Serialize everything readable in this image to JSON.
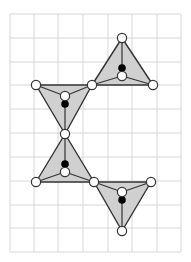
{
  "diagram": {
    "type": "tetrahedra-chain-on-grid",
    "colors": {
      "background": "#ffffff",
      "grid": "#d6d6d6",
      "fill": "#d0d0d0",
      "stroke": "#333333",
      "open_atom": "#ffffff",
      "filled_atom": "#000000"
    },
    "grid": {
      "x_lines": [
        10,
        34,
        58,
        83,
        108,
        132,
        157,
        181
      ],
      "y_lines": [
        14,
        38,
        62,
        85,
        109,
        133,
        157,
        181,
        205,
        228,
        252
      ]
    },
    "triangles": [
      {
        "name": "tetra-1",
        "corners": [
          [
            122,
            38
          ],
          [
            92,
            85
          ],
          [
            153,
            85
          ]
        ],
        "inner_open": [
          122,
          76
        ],
        "center_filled": [
          122,
          68
        ]
      },
      {
        "name": "tetra-2",
        "corners": [
          [
            36,
            85
          ],
          [
            92,
            85
          ],
          [
            65,
            134
          ]
        ],
        "inner_open": [
          65,
          96
        ],
        "center_filled": [
          65,
          104
        ]
      },
      {
        "name": "tetra-3",
        "corners": [
          [
            65,
            134
          ],
          [
            36,
            182
          ],
          [
            94,
            182
          ]
        ],
        "inner_open": [
          65,
          172
        ],
        "center_filled": [
          65,
          164
        ]
      },
      {
        "name": "tetra-4",
        "corners": [
          [
            94,
            182
          ],
          [
            151,
            182
          ],
          [
            122,
            231
          ]
        ],
        "inner_open": [
          122,
          192
        ],
        "center_filled": [
          122,
          200
        ]
      }
    ]
  }
}
